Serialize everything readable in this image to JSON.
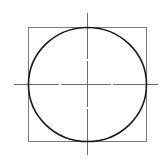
{
  "diagram": {
    "type": "circle-inscribed-in-square-with-centerlines",
    "caption": "",
    "canvas": {
      "width": 167,
      "height": 165
    },
    "colors": {
      "background": "#ffffff",
      "circle_stroke": "#1a1a1a",
      "square_stroke": "#7a7a7a",
      "centerline_stroke": "#6e6e6e"
    },
    "square": {
      "x": 28,
      "y": 27,
      "width": 118,
      "height": 114
    },
    "circle": {
      "cx": 87,
      "cy": 84,
      "rx": 59,
      "ry": 57
    },
    "centerlines": {
      "horizontal": {
        "y": 84,
        "x1": 14,
        "x2": 158,
        "gaps_at_x": [
          60,
          112
        ]
      },
      "vertical": {
        "x": 87,
        "y1": 13,
        "y2": 155,
        "gaps_at_y": [
          60,
          108
        ]
      }
    }
  }
}
